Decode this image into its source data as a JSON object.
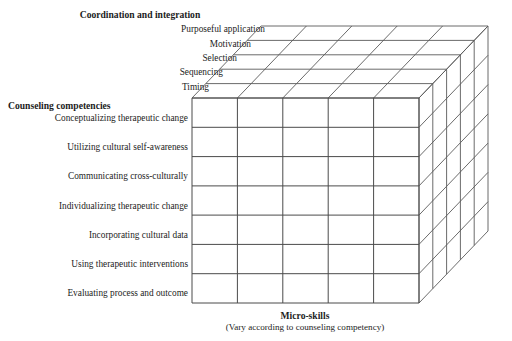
{
  "figure": {
    "type": "three-dimensional-matrix-cube",
    "axes": {
      "depth": {
        "title": "Coordination and integration",
        "labels": [
          "Purposeful application",
          "Motivation",
          "Selection",
          "Sequencing",
          "Timing"
        ]
      },
      "vertical": {
        "title": "Counseling competencies",
        "labels": [
          "Conceptualizing therapeutic change",
          "Utilizing cultural self-awareness",
          "Communicating cross-culturally",
          "Individualizing therapeutic change",
          "Incorporating cultural data",
          "Using therapeutic interventions",
          "Evaluating process and outcome"
        ]
      },
      "horizontal": {
        "title": "Micro-skills",
        "subtitle": "(Vary according to counseling competency)",
        "columns": 5
      }
    },
    "colors": {
      "line": "#5a5a5a",
      "line_dark": "#404040",
      "background": "#ffffff",
      "text": "#1c1c1c"
    }
  }
}
